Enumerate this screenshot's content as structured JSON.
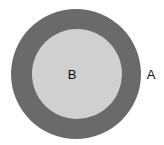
{
  "diagram": {
    "outer": {
      "label": "A",
      "color": "#6a6a6a",
      "cx": 76,
      "cy": 74,
      "r": 65
    },
    "inner": {
      "label": "B",
      "color": "#d0d0d0",
      "cx": 77,
      "cy": 74,
      "r": 45
    }
  }
}
